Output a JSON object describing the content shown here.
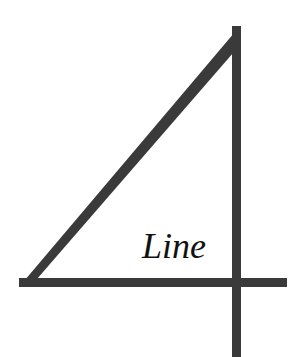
{
  "logo": {
    "wordmark": "Line",
    "stroke_color": "#3a3a3a",
    "text_color": "#111111",
    "background": "#ffffff",
    "shape": "stylized numeral 4 formed by a right triangle with extended vertical and horizontal strokes"
  }
}
